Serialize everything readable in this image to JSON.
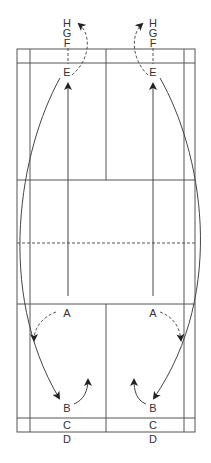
{
  "diagram": {
    "type": "badminton-court-movement",
    "colors": {
      "lines": "#555555",
      "text": "#333333",
      "background": "#ffffff"
    },
    "left_positions": {
      "H": "H",
      "G": "G",
      "F": "F",
      "E": "E",
      "A": "A",
      "B": "B",
      "C": "C",
      "D": "D"
    },
    "right_positions": {
      "H": "H",
      "G": "G",
      "F": "F",
      "E": "E",
      "A": "A",
      "B": "B",
      "C": "C",
      "D": "D"
    }
  }
}
